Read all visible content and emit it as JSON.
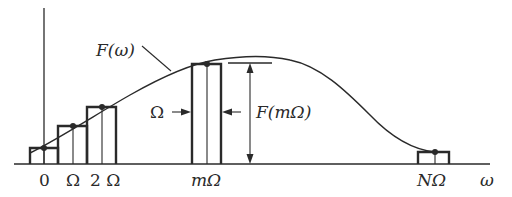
{
  "diagram": {
    "curve_label": "F(ω)",
    "axis_label": "ω",
    "x_ticks": [
      "0",
      "Ω",
      "2 Ω",
      "mΩ",
      "NΩ"
    ],
    "width_label": "Ω",
    "height_label": "F(mΩ)",
    "colors": {
      "ink": "#2a2a2a",
      "background": "#ffffff"
    }
  }
}
